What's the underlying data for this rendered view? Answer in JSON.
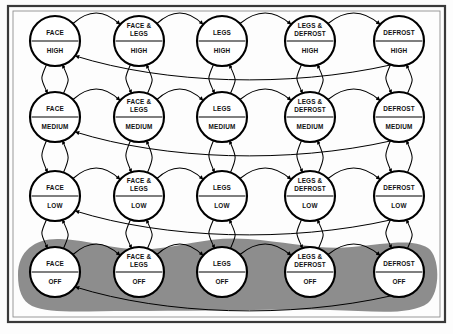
{
  "diagram": {
    "type": "state-transition-diagram",
    "title": "",
    "background_color": "#fdfdfd",
    "frame_color": "#3a3a3a",
    "node_fill": "#ffffff",
    "node_stroke": "#000000",
    "highlight_region_color": "#8d8d8d",
    "highlight_region_label": "OFF states group",
    "columns": [
      {
        "id": "face",
        "name_lines": [
          "FACE"
        ],
        "cx": 55
      },
      {
        "id": "face-legs",
        "name_lines": [
          "FACE &",
          "LEGS"
        ],
        "cx": 139
      },
      {
        "id": "legs",
        "name_lines": [
          "LEGS"
        ],
        "cx": 222
      },
      {
        "id": "legs-defrost",
        "name_lines": [
          "LEGS &",
          "DEFROST"
        ],
        "cx": 310
      },
      {
        "id": "defrost",
        "name_lines": [
          "DEFROST"
        ],
        "cx": 399
      }
    ],
    "rows": [
      {
        "id": "high",
        "mode": "HIGH",
        "cy": 41
      },
      {
        "id": "medium",
        "mode": "MEDIUM",
        "cy": 117
      },
      {
        "id": "low",
        "mode": "LOW",
        "cy": 196
      },
      {
        "id": "off",
        "mode": "OFF",
        "cy": 272
      }
    ],
    "node_radius": 25,
    "nodes": [
      {
        "id": "face-high",
        "name_lines": [
          "FACE"
        ],
        "mode": "HIGH",
        "col": 0,
        "row": 0
      },
      {
        "id": "face-legs-high",
        "name_lines": [
          "FACE &",
          "LEGS"
        ],
        "mode": "HIGH",
        "col": 1,
        "row": 0
      },
      {
        "id": "legs-high",
        "name_lines": [
          "LEGS"
        ],
        "mode": "HIGH",
        "col": 2,
        "row": 0
      },
      {
        "id": "legs-defrost-high",
        "name_lines": [
          "LEGS &",
          "DEFROST"
        ],
        "mode": "HIGH",
        "col": 3,
        "row": 0
      },
      {
        "id": "defrost-high",
        "name_lines": [
          "DEFROST"
        ],
        "mode": "HIGH",
        "col": 4,
        "row": 0
      },
      {
        "id": "face-medium",
        "name_lines": [
          "FACE"
        ],
        "mode": "MEDIUM",
        "col": 0,
        "row": 1
      },
      {
        "id": "face-legs-medium",
        "name_lines": [
          "FACE &",
          "LEGS"
        ],
        "mode": "MEDIUM",
        "col": 1,
        "row": 1
      },
      {
        "id": "legs-medium",
        "name_lines": [
          "LEGS"
        ],
        "mode": "MEDIUM",
        "col": 2,
        "row": 1
      },
      {
        "id": "legs-defrost-medium",
        "name_lines": [
          "LEGS &",
          "DEFROST"
        ],
        "mode": "MEDIUM",
        "col": 3,
        "row": 1
      },
      {
        "id": "defrost-medium",
        "name_lines": [
          "DEFROST"
        ],
        "mode": "MEDIUM",
        "col": 4,
        "row": 1
      },
      {
        "id": "face-low",
        "name_lines": [
          "FACE"
        ],
        "mode": "LOW",
        "col": 0,
        "row": 2
      },
      {
        "id": "face-legs-low",
        "name_lines": [
          "FACE &",
          "LEGS"
        ],
        "mode": "LOW",
        "col": 1,
        "row": 2
      },
      {
        "id": "legs-low",
        "name_lines": [
          "LEGS"
        ],
        "mode": "LOW",
        "col": 2,
        "row": 2
      },
      {
        "id": "legs-defrost-low",
        "name_lines": [
          "LEGS &",
          "DEFROST"
        ],
        "mode": "LOW",
        "col": 3,
        "row": 2
      },
      {
        "id": "defrost-low",
        "name_lines": [
          "DEFROST"
        ],
        "mode": "LOW",
        "col": 4,
        "row": 2
      },
      {
        "id": "face-off",
        "name_lines": [
          "FACE"
        ],
        "mode": "OFF",
        "col": 0,
        "row": 3
      },
      {
        "id": "face-legs-off",
        "name_lines": [
          "FACE &",
          "LEGS"
        ],
        "mode": "OFF",
        "col": 1,
        "row": 3
      },
      {
        "id": "legs-off",
        "name_lines": [
          "LEGS"
        ],
        "mode": "OFF",
        "col": 2,
        "row": 3
      },
      {
        "id": "legs-defrost-off",
        "name_lines": [
          "LEGS &",
          "DEFROST"
        ],
        "mode": "OFF",
        "col": 3,
        "row": 3
      },
      {
        "id": "defrost-off",
        "name_lines": [
          "DEFROST"
        ],
        "mode": "OFF",
        "col": 4,
        "row": 3
      }
    ],
    "edges": {
      "horizontal_forward": "adjacent column, left to right, arc above",
      "horizontal_wrap_back": "rightmost column back to leftmost column, long arc below",
      "vertical_down": "row above to row below, arc",
      "vertical_up": "row below to row above, arc"
    }
  }
}
